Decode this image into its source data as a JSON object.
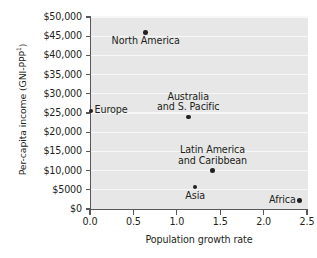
{
  "chart_data": {
    "type": "scatter",
    "title": "",
    "xlabel": "Population growth rate",
    "ylabel": "Per-capita income (GNI-PPP",
    "ylabel_superscript": "1",
    "ylabel_suffix": ")",
    "xlim": [
      0.0,
      2.5
    ],
    "ylim": [
      0,
      50000
    ],
    "xticks": [
      "0.0",
      "0.5",
      "1.0",
      "1.5",
      "2.0",
      "2.5"
    ],
    "xtick_values": [
      0.0,
      0.5,
      1.0,
      1.5,
      2.0,
      2.5
    ],
    "yticks": [
      "$0",
      "$5000",
      "$10,000",
      "$15,000",
      "$20,000",
      "$25,000",
      "$30,000",
      "$35,000",
      "$40,000",
      "$45,000",
      "$50,000"
    ],
    "ytick_values": [
      0,
      5000,
      10000,
      15000,
      20000,
      25000,
      30000,
      35000,
      40000,
      45000,
      50000
    ],
    "grid": "horizontal",
    "legend": "none",
    "plot_background": "#e7e7e7",
    "gridline_color": "#f7f7f7",
    "marker_color": "#231f20",
    "axis_color": "#58585a",
    "points": [
      {
        "name": "North America",
        "x": 0.63,
        "y": 46000,
        "label": "North America",
        "label_pos": "below",
        "label_lines": [
          "North America"
        ]
      },
      {
        "name": "Europe",
        "x": 0.0,
        "y": 25500,
        "label": "Europe",
        "label_pos": "right",
        "label_lines": [
          "Europe"
        ]
      },
      {
        "name": "Australia and S. Pacific",
        "x": 1.12,
        "y": 24000,
        "label": "Australia and S. Pacific",
        "label_pos": "above",
        "label_lines": [
          "Australia",
          "and S. Pacific"
        ]
      },
      {
        "name": "Latin America and Caribbean",
        "x": 1.4,
        "y": 10000,
        "label": "Latin America and Caribbean",
        "label_pos": "above",
        "label_lines": [
          "Latin America",
          "and Caribbean"
        ]
      },
      {
        "name": "Asia",
        "x": 1.2,
        "y": 5700,
        "label": "Asia",
        "label_pos": "below",
        "label_lines": [
          "Asia"
        ]
      },
      {
        "name": "Africa",
        "x": 2.4,
        "y": 2200,
        "label": "Africa",
        "label_pos": "left",
        "label_lines": [
          "Africa"
        ]
      }
    ]
  }
}
